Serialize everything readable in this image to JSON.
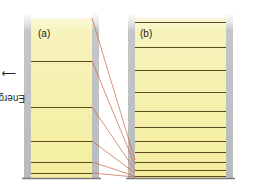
{
  "diagram": {
    "axis_label": "Energy",
    "axis_arrow": "up-arrow",
    "colors": {
      "panel_fill": "#f6f0a8",
      "panel_fill_top": "#fbf8dc",
      "wall": "#c4c6c8",
      "level_line": "#5a4a20",
      "connector": "#c8643c",
      "baseline": "#7a7a7a"
    },
    "panels": [
      {
        "id": "a",
        "label": "(a)",
        "x": 31,
        "width": 61,
        "top": 18,
        "bottom": 178,
        "levels_y": [
          61,
          107,
          141,
          162,
          173
        ]
      },
      {
        "id": "b",
        "label": "(b)",
        "x": 135,
        "width": 91,
        "top": 18,
        "bottom": 178,
        "levels_y": [
          22,
          47,
          70,
          92,
          111,
          127,
          141,
          152,
          162,
          170,
          176
        ]
      }
    ],
    "connectors": [
      {
        "from_y": 18,
        "to_y": 160
      },
      {
        "from_y": 61,
        "to_y": 165
      },
      {
        "from_y": 107,
        "to_y": 170
      },
      {
        "from_y": 141,
        "to_y": 173
      },
      {
        "from_y": 162,
        "to_y": 176
      },
      {
        "from_y": 173,
        "to_y": 177
      }
    ]
  }
}
